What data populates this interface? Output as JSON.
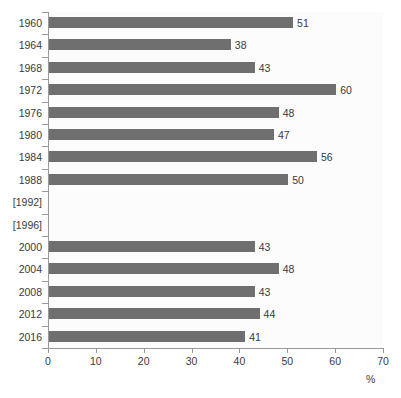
{
  "chart_data": {
    "type": "bar",
    "orientation": "horizontal",
    "title": "",
    "subtitle": "",
    "xlabel": "%",
    "ylabel": "",
    "xlim": [
      0,
      70
    ],
    "xticks": [
      0,
      10,
      20,
      30,
      40,
      50,
      60,
      70
    ],
    "grid": false,
    "legend": null,
    "categories": [
      "1960",
      "1964",
      "1968",
      "1972",
      "1976",
      "1980",
      "1984",
      "1988",
      "[1992]",
      "[1996]",
      "2000",
      "2004",
      "2008",
      "2012",
      "2016"
    ],
    "values": [
      51,
      38,
      43,
      60,
      48,
      47,
      56,
      50,
      null,
      null,
      43,
      48,
      43,
      44,
      41
    ],
    "value_labels": [
      "51",
      "38",
      "43",
      "60",
      "48",
      "47",
      "56",
      "50",
      "",
      "",
      "43",
      "48",
      "43",
      "44",
      "41"
    ],
    "bar_color": "#706f6f",
    "plot_background": "#fcfcfc",
    "axis_color": "#9a9a9a",
    "text_color": "#3a3a3a"
  },
  "axis": {
    "unit_label": "%"
  }
}
